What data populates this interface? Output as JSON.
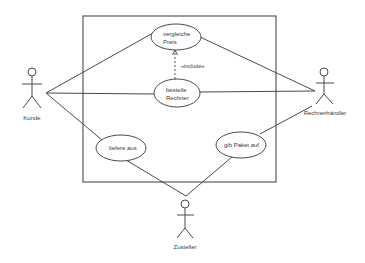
{
  "diagram": {
    "type": "uml-use-case",
    "colors": {
      "line": "#4a4a4a",
      "text": "#3a3a3a",
      "background": "#ffffff"
    },
    "actors": [
      {
        "id": "kunde",
        "label": "Kunde"
      },
      {
        "id": "rechnerhaendler",
        "label": "Rechnerhändler"
      },
      {
        "id": "zusteller",
        "label": "Zusteller"
      }
    ],
    "use_cases": [
      {
        "id": "vergleiche-preis",
        "lines": [
          "vergleiche",
          "Preis"
        ]
      },
      {
        "id": "bestelle-rechner",
        "lines": [
          "bestelle",
          "Rechner"
        ]
      },
      {
        "id": "liefere-aus",
        "lines": [
          "liefere aus"
        ]
      },
      {
        "id": "gib-paket-auf",
        "lines": [
          "gib Paket auf"
        ]
      }
    ],
    "relations": [
      {
        "from": "kunde",
        "to": "vergleiche-preis",
        "type": "association"
      },
      {
        "from": "kunde",
        "to": "bestelle-rechner",
        "type": "association"
      },
      {
        "from": "kunde",
        "to": "liefere-aus",
        "type": "association"
      },
      {
        "from": "rechnerhaendler",
        "to": "vergleiche-preis",
        "type": "association"
      },
      {
        "from": "rechnerhaendler",
        "to": "bestelle-rechner",
        "type": "association"
      },
      {
        "from": "rechnerhaendler",
        "to": "gib-paket-auf",
        "type": "association"
      },
      {
        "from": "zusteller",
        "to": "liefere-aus",
        "type": "association"
      },
      {
        "from": "zusteller",
        "to": "gib-paket-auf",
        "type": "association"
      },
      {
        "from": "bestelle-rechner",
        "to": "vergleiche-preis",
        "type": "include",
        "label": "«include»"
      }
    ],
    "include_label": "«include»"
  }
}
